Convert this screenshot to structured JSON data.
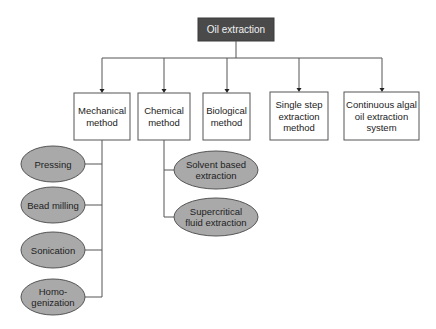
{
  "diagram": {
    "root": {
      "label": "Oil extraction"
    },
    "methods": [
      {
        "id": "mechanical",
        "lines": [
          "Mechanical",
          "method"
        ]
      },
      {
        "id": "chemical",
        "lines": [
          "Chemical",
          "method"
        ]
      },
      {
        "id": "biological",
        "lines": [
          "Biological",
          "method"
        ]
      },
      {
        "id": "single-step",
        "lines": [
          "Single step",
          "extraction",
          "method"
        ]
      },
      {
        "id": "continuous",
        "lines": [
          "Continuous algal",
          "oil extraction",
          "system"
        ]
      }
    ],
    "mechanical_subtypes": [
      {
        "lines": [
          "Pressing"
        ]
      },
      {
        "lines": [
          "Bead milling"
        ]
      },
      {
        "lines": [
          "Sonication"
        ]
      },
      {
        "lines": [
          "Homo-",
          "genization"
        ]
      }
    ],
    "chemical_subtypes": [
      {
        "lines": [
          "Solvent based",
          "extraction"
        ]
      },
      {
        "lines": [
          "Supercritical",
          "fluid extraction"
        ]
      }
    ],
    "colors": {
      "root_fill": "#4a4a4a",
      "ellipse_fill": "#a9a9a9",
      "line": "#555555"
    }
  }
}
